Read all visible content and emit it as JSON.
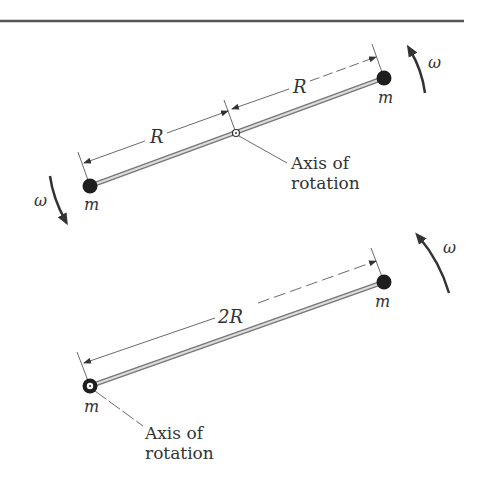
{
  "figure": {
    "top": {
      "dim_left": "R",
      "dim_right": "R",
      "mass_left": "m",
      "mass_right": "m",
      "omega_left": "ω",
      "omega_right": "ω",
      "axis_label_line1": "Axis of",
      "axis_label_line2": "rotation"
    },
    "bottom": {
      "dim": "2R",
      "mass_left": "m",
      "mass_right": "m",
      "omega": "ω",
      "axis_label_line1": "Axis of",
      "axis_label_line2": "rotation"
    }
  },
  "colors": {
    "ink": "#333333",
    "mass": "#1e1e1e",
    "rod": "#8a8a8a",
    "rule": "#555555"
  }
}
